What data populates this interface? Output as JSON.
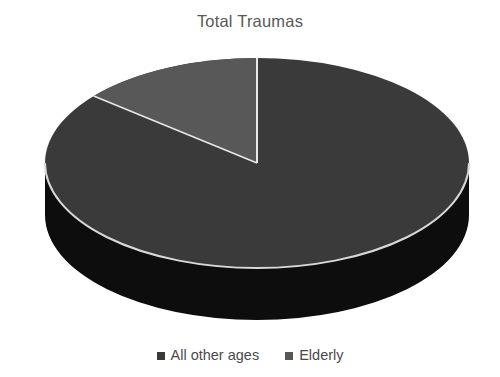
{
  "chart_data": {
    "type": "pie",
    "title": "Total Traumas",
    "subtitle": "",
    "xlabel": "",
    "ylabel": "",
    "three_d": true,
    "legend_position": "bottom",
    "grid": false,
    "start_angle_deg": 0,
    "direction": "counterclockwise",
    "categories": [
      "All other ages",
      "Elderly"
    ],
    "values": [
      86,
      14
    ],
    "slices": [
      {
        "label": "All other ages",
        "value": 86,
        "percent": "86%",
        "color": "#3a3a3a",
        "side_color": "#0d0d0d"
      },
      {
        "label": "Elderly",
        "value": 14,
        "percent": "14%",
        "color": "#585858",
        "side_color": "#0d0d0d"
      }
    ]
  },
  "chart": {
    "title": "Total Traumas",
    "background": "#ffffff",
    "title_color": "#595959",
    "divider_color": "#e8e8e8",
    "rim_color": "#d8d8d8"
  },
  "legend": {
    "items": [
      {
        "label": "All other ages",
        "color": "#3a3a3a",
        "marker": "square-marker"
      },
      {
        "label": "Elderly",
        "color": "#585858",
        "marker": "square-marker"
      }
    ]
  }
}
